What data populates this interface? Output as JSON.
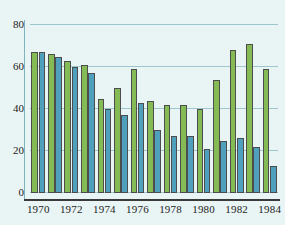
{
  "chart_data": {
    "type": "bar",
    "title": "",
    "subtitle": "",
    "xlabel": "",
    "ylabel": "",
    "grid": true,
    "legend": "none",
    "ylim": [
      0,
      80
    ],
    "yticks": [
      0,
      20,
      40,
      60,
      80
    ],
    "ytick_labels": [
      "0",
      "20",
      "40",
      "60",
      "80"
    ],
    "categories": [
      "1970",
      "1971",
      "1972",
      "1973",
      "1974",
      "1975",
      "1976",
      "1977",
      "1978",
      "1979",
      "1980",
      "1981",
      "1982",
      "1983",
      "1984"
    ],
    "xtick_labels": [
      "1970",
      "1972",
      "1974",
      "1976",
      "1978",
      "1980",
      "1982",
      "1984"
    ],
    "xtick_categories": [
      "1970",
      "1972",
      "1974",
      "1976",
      "1978",
      "1980",
      "1982",
      "1984"
    ],
    "series": [
      {
        "name": "green-series",
        "color": "#84bb55",
        "values": [
          67,
          66,
          63,
          61,
          45,
          50,
          59,
          44,
          42,
          42,
          40,
          54,
          68,
          71,
          59
        ]
      },
      {
        "name": "blue-series",
        "color": "#4fa0bc",
        "values": [
          67,
          65,
          60,
          57,
          40,
          37,
          43,
          30,
          27,
          27,
          21,
          25,
          26,
          22,
          13
        ]
      }
    ]
  },
  "colors": {
    "background": "#e9f4f4",
    "gridline": "#9dc6cf",
    "axis": "#3a3a3a",
    "bar_outline": "#4d4d4d",
    "green": "#84bb55",
    "blue": "#4fa0bc",
    "text": "#1d1d1d"
  }
}
